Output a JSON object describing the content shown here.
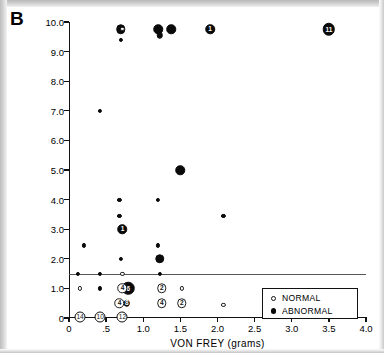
{
  "figure": {
    "panel_label": "B"
  },
  "legend": {
    "position": "bottom-right",
    "entries": [
      {
        "label": "NORMAL",
        "marker": "open-circle",
        "color": "#ffffff"
      },
      {
        "label": "ABNORMAL",
        "marker": "filled-circle",
        "color": "#0a0a0a"
      }
    ]
  },
  "chart_data": {
    "type": "scatter",
    "title": "",
    "subtitle": "",
    "panel_label": "B",
    "xlabel": "VON FREY (grams)",
    "ylabel": "RIDGE (cm)",
    "xlim": [
      0,
      4.0
    ],
    "ylim": [
      0,
      10.0
    ],
    "xticks": [
      0,
      0.5,
      1.0,
      1.5,
      2.0,
      2.5,
      3.0,
      3.5,
      4.0
    ],
    "xticklabels": [
      "0",
      ".5",
      "1.0",
      "1.5",
      "2.0",
      "2.5",
      "3.0",
      "3.5",
      "4.0"
    ],
    "yticks": [
      0,
      1.0,
      2.0,
      3.0,
      4.0,
      5.0,
      6.0,
      7.0,
      8.0,
      9.0,
      10.0
    ],
    "yticklabels": [
      "0",
      "1.0",
      "2.0",
      "3.0",
      "4.0",
      "5.0",
      "6.0",
      "7.0",
      "8.0",
      "9.0",
      "10.0"
    ],
    "grid": false,
    "legend_position": "lower right",
    "annotations": [
      {
        "type": "hline",
        "y": 1.5,
        "label": "reference line at RIDGE = 1.5 cm"
      }
    ],
    "series": [
      {
        "name": "ABNORMAL",
        "marker": "filled-circle",
        "color": "#0a0a0a",
        "points": [
          {
            "x": 0.7,
            "y": 9.75,
            "count": 1,
            "size": "large"
          },
          {
            "x": 0.7,
            "y": 9.4,
            "count": 1,
            "size": "small"
          },
          {
            "x": 1.2,
            "y": 9.75,
            "count": 1,
            "size": "large"
          },
          {
            "x": 1.22,
            "y": 9.55,
            "count": 1,
            "size": "medium"
          },
          {
            "x": 1.38,
            "y": 9.75,
            "count": 1,
            "size": "large"
          },
          {
            "x": 1.9,
            "y": 9.75,
            "count": 1,
            "size": "large",
            "label": "1"
          },
          {
            "x": 3.5,
            "y": 9.75,
            "count": 11,
            "size": "xlarge",
            "label": "11"
          },
          {
            "x": 0.42,
            "y": 7.0,
            "count": 1,
            "size": "small"
          },
          {
            "x": 1.5,
            "y": 5.0,
            "count": 1,
            "size": "large"
          },
          {
            "x": 0.68,
            "y": 4.0,
            "count": 1,
            "size": "small"
          },
          {
            "x": 1.2,
            "y": 4.0,
            "count": 1,
            "size": "small"
          },
          {
            "x": 0.68,
            "y": 3.45,
            "count": 1,
            "size": "small"
          },
          {
            "x": 2.08,
            "y": 3.45,
            "count": 1,
            "size": "small"
          },
          {
            "x": 0.72,
            "y": 3.0,
            "count": 1,
            "size": "large",
            "label": "1"
          },
          {
            "x": 0.2,
            "y": 2.45,
            "count": 1,
            "size": "small"
          },
          {
            "x": 1.2,
            "y": 2.45,
            "count": 1,
            "size": "small"
          },
          {
            "x": 0.7,
            "y": 2.0,
            "count": 1,
            "size": "small"
          },
          {
            "x": 1.22,
            "y": 2.0,
            "count": 1,
            "size": "large"
          },
          {
            "x": 0.12,
            "y": 1.5,
            "count": 1,
            "size": "small"
          },
          {
            "x": 0.42,
            "y": 1.5,
            "count": 1,
            "size": "small"
          },
          {
            "x": 1.22,
            "y": 1.5,
            "count": 1,
            "size": "small"
          },
          {
            "x": 0.42,
            "y": 1.0,
            "count": 1,
            "size": "small"
          },
          {
            "x": 0.8,
            "y": 1.0,
            "count": 6,
            "size": "xlarge",
            "label": "6"
          },
          {
            "x": 0.78,
            "y": 0.5,
            "count": 8,
            "size": "medium",
            "label": "8"
          },
          {
            "x": 0.15,
            "y": 0.05,
            "count": 14,
            "size": "count",
            "label": "14"
          },
          {
            "x": 0.42,
            "y": 0.05,
            "count": 10,
            "size": "count",
            "label": "10"
          },
          {
            "x": 0.72,
            "y": 0.05,
            "count": 12,
            "size": "count",
            "label": "12"
          }
        ]
      },
      {
        "name": "NORMAL",
        "marker": "open-circle",
        "color": "#ffffff",
        "points": [
          {
            "x": 0.72,
            "y": 9.78,
            "count": 1,
            "size": "small"
          },
          {
            "x": 0.72,
            "y": 1.5,
            "count": 1,
            "size": "small"
          },
          {
            "x": 0.15,
            "y": 1.0,
            "count": 1,
            "size": "small"
          },
          {
            "x": 0.72,
            "y": 1.0,
            "count": 4,
            "size": "large",
            "label": "4"
          },
          {
            "x": 1.25,
            "y": 1.0,
            "count": 2,
            "size": "large",
            "label": "2"
          },
          {
            "x": 1.52,
            "y": 1.0,
            "count": 1,
            "size": "small"
          },
          {
            "x": 0.68,
            "y": 0.5,
            "count": 4,
            "size": "large",
            "label": "4"
          },
          {
            "x": 1.25,
            "y": 0.5,
            "count": 4,
            "size": "large",
            "label": "4"
          },
          {
            "x": 1.52,
            "y": 0.5,
            "count": 2,
            "size": "large",
            "label": "2"
          },
          {
            "x": 2.08,
            "y": 0.45,
            "count": 1,
            "size": "small"
          },
          {
            "x": 3.08,
            "y": 0.4,
            "count": 1,
            "size": "small"
          }
        ]
      }
    ]
  }
}
